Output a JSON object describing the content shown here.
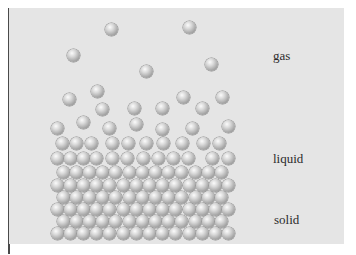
{
  "diagram": {
    "title": "",
    "labels": {
      "gas": {
        "text": "gas",
        "x": 273,
        "y": 48
      },
      "liquid": {
        "text": "liquid",
        "x": 273,
        "y": 151
      },
      "solid": {
        "text": "solid",
        "x": 274,
        "y": 212
      }
    },
    "colors": {
      "panel": "#e5e5e5",
      "ball": "#b0b0b0",
      "text": "#2b2b2b"
    },
    "ball_diameter": 13,
    "gas_particles": [
      [
        111,
        29
      ],
      [
        189,
        27
      ],
      [
        73,
        55
      ],
      [
        146,
        71
      ],
      [
        211,
        64
      ]
    ],
    "liquid_particles": [
      [
        97,
        91
      ],
      [
        69,
        99
      ],
      [
        183,
        97
      ],
      [
        222,
        97
      ],
      [
        102,
        109
      ],
      [
        134,
        108
      ],
      [
        162,
        108
      ],
      [
        202,
        108
      ],
      [
        83,
        122
      ],
      [
        136,
        124
      ],
      [
        228,
        126
      ],
      [
        57,
        128
      ],
      [
        109,
        128
      ],
      [
        162,
        129
      ],
      [
        192,
        128
      ],
      [
        62,
        143
      ],
      [
        76,
        143
      ],
      [
        91,
        143
      ],
      [
        112,
        143
      ],
      [
        128,
        143
      ],
      [
        146,
        143
      ],
      [
        163,
        143
      ],
      [
        182,
        143
      ],
      [
        203,
        143
      ],
      [
        219,
        143
      ],
      [
        57,
        158
      ],
      [
        70,
        158
      ],
      [
        83,
        158
      ],
      [
        96,
        158
      ],
      [
        112,
        158
      ],
      [
        127,
        158
      ],
      [
        143,
        158
      ],
      [
        158,
        158
      ],
      [
        173,
        158
      ],
      [
        188,
        158
      ],
      [
        212,
        158
      ],
      [
        228,
        158
      ]
    ],
    "solid_rows": [
      {
        "y": 172,
        "x_start": 63,
        "count": 13
      },
      {
        "y": 185,
        "x_start": 57,
        "count": 14
      },
      {
        "y": 197,
        "x_start": 63,
        "count": 13
      },
      {
        "y": 209,
        "x_start": 57,
        "count": 14
      },
      {
        "y": 221,
        "x_start": 63,
        "count": 13
      },
      {
        "y": 233,
        "x_start": 57,
        "count": 14
      }
    ],
    "solid_spacing": 13.2
  }
}
